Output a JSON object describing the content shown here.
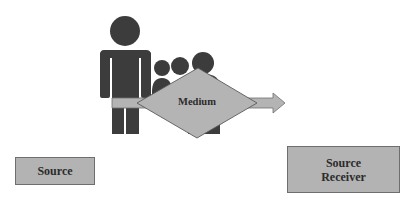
{
  "diagram": {
    "nodes": {
      "source": {
        "label": "Source"
      },
      "medium": {
        "label": "Medium"
      },
      "receiver": {
        "line1": "Source",
        "line2": "Receiver"
      }
    },
    "icons": {
      "person": "person-icon",
      "group": "group-of-people-icon",
      "arrow": "arrow-right-icon"
    },
    "colors": {
      "people": "#3c3c3c",
      "shape_fill": "#b4b4b4",
      "shape_stroke": "#6e6e6e",
      "text": "#2b2b2b",
      "background": "#ffffff"
    }
  }
}
